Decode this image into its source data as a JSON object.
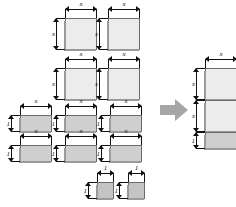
{
  "diagram": {
    "labels": {
      "x": "x",
      "one": "1"
    },
    "colors": {
      "x_squared_tile": "#ececec",
      "x_tile": "#cfcfcf",
      "unit_tile": "#c4c4c4",
      "tile_border": "#6b6b6b",
      "tile_shadow": "#9a9a9a",
      "dimension_line": "#111111",
      "arrow": "#a6a6a6",
      "background": "#ffffff"
    },
    "left_group": {
      "name": "loose-tiles",
      "x_squared_tiles": [
        {
          "id": "x2-1",
          "left": 65,
          "top": 18,
          "width": 32,
          "height": 32,
          "width_label": "x",
          "height_label": "x"
        },
        {
          "id": "x2-2",
          "left": 108,
          "top": 18,
          "width": 32,
          "height": 32,
          "width_label": "x",
          "height_label": "x"
        },
        {
          "id": "x2-3",
          "left": 65,
          "top": 68,
          "width": 32,
          "height": 32,
          "width_label": "x",
          "height_label": "x"
        },
        {
          "id": "x2-4",
          "left": 108,
          "top": 68,
          "width": 32,
          "height": 32,
          "width_label": "x",
          "height_label": "x"
        }
      ],
      "x_tiles": [
        {
          "id": "x-1",
          "left": 20,
          "top": 115,
          "width": 32,
          "height": 17,
          "width_label": "x",
          "height_label": "1"
        },
        {
          "id": "x-2",
          "left": 65,
          "top": 115,
          "width": 32,
          "height": 17,
          "width_label": "x",
          "height_label": "1"
        },
        {
          "id": "x-3",
          "left": 110,
          "top": 115,
          "width": 32,
          "height": 17,
          "width_label": "x",
          "height_label": "1"
        },
        {
          "id": "x-4",
          "left": 20,
          "top": 145,
          "width": 32,
          "height": 17,
          "width_label": "x",
          "height_label": "1"
        },
        {
          "id": "x-5",
          "left": 65,
          "top": 145,
          "width": 32,
          "height": 17,
          "width_label": "x",
          "height_label": "1"
        },
        {
          "id": "x-6",
          "left": 110,
          "top": 145,
          "width": 32,
          "height": 17,
          "width_label": "x",
          "height_label": "1"
        }
      ],
      "unit_tiles": [
        {
          "id": "u-1",
          "left": 97,
          "top": 182,
          "width": 17,
          "height": 17,
          "width_label": "1",
          "height_label": "1"
        },
        {
          "id": "u-2",
          "left": 128,
          "top": 182,
          "width": 17,
          "height": 17,
          "width_label": "1",
          "height_label": "1"
        }
      ]
    },
    "arrow": {
      "name": "transformation-arrow",
      "direction": "right",
      "left": 160,
      "top": 99,
      "width": 28,
      "height": 22
    },
    "right_group": {
      "name": "assembled-stack",
      "left": 205,
      "top": 68,
      "width": 32,
      "segments": [
        {
          "id": "stack-x2-1",
          "type": "x_squared",
          "height": 32,
          "height_label": "x"
        },
        {
          "id": "stack-x2-2",
          "type": "x_squared",
          "height": 32,
          "height_label": "x"
        },
        {
          "id": "stack-x-1",
          "type": "x_tile",
          "height": 17,
          "height_label": "1"
        }
      ],
      "width_label": "x"
    }
  }
}
